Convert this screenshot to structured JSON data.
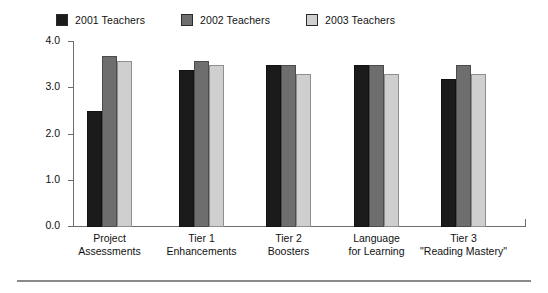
{
  "chart_data": {
    "type": "bar",
    "title": "",
    "xlabel": "",
    "ylabel": "Mean Satisfaction Score",
    "ylim": [
      0.0,
      4.0
    ],
    "ytick_labels": [
      "4.0",
      "3.0",
      "2.0",
      "1.0",
      "0.0"
    ],
    "ytick_values": [
      4.0,
      3.0,
      2.0,
      1.0,
      0.0
    ],
    "grid": false,
    "legend_position": "top-left",
    "categories": [
      "Project\nAssessments",
      "Tier 1\nEnhancements",
      "Tier 2\nBoosters",
      "Language\nfor Learning",
      "Tier 3\n\"Reading Mastery\""
    ],
    "category_lines": [
      [
        "Project",
        "Assessments"
      ],
      [
        "Tier 1",
        "Enhancements"
      ],
      [
        "Tier 2",
        "Boosters"
      ],
      [
        "Language",
        "for Learning"
      ],
      [
        "Tier 3",
        "\"Reading Mastery\""
      ]
    ],
    "series": [
      {
        "name": "2001 Teachers",
        "color": "#1b1b1b",
        "values": [
          2.5,
          3.4,
          3.5,
          3.5,
          3.2
        ]
      },
      {
        "name": "2002 Teachers",
        "color": "#6e6e6e",
        "values": [
          3.7,
          3.6,
          3.5,
          3.5,
          3.5
        ]
      },
      {
        "name": "2003 Teachers",
        "color": "#cfcfcf",
        "values": [
          3.6,
          3.5,
          3.3,
          3.3,
          3.3
        ]
      }
    ]
  },
  "legend": {
    "items": [
      {
        "label": "2001 Teachers",
        "color": "#1b1b1b"
      },
      {
        "label": "2002 Teachers",
        "color": "#6e6e6e"
      },
      {
        "label": "2003 Teachers",
        "color": "#cfcfcf"
      }
    ]
  },
  "axes": {
    "y_title": "Mean Satisfaction Score"
  }
}
